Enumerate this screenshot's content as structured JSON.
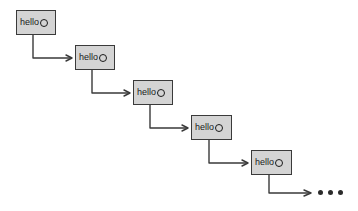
{
  "diagram": {
    "type": "linked-list-chain",
    "title": "",
    "background_color": "#ffffff",
    "node_fill_color": "#d4d4d4",
    "node_border_color": "#3a3a3a",
    "connector_color": "#3a3a3a",
    "text_color": "#1a1a1a",
    "node_label": "hello",
    "node_pointer_icon": "empty-circle-ring",
    "nodes": [
      {
        "id": "node-1",
        "label": "hello",
        "pointer": "ring",
        "x": 16,
        "y": 10,
        "width": 40,
        "height": 25
      },
      {
        "id": "node-2",
        "label": "hello",
        "pointer": "ring",
        "x": 75,
        "y": 45,
        "width": 40,
        "height": 25
      },
      {
        "id": "node-3",
        "label": "hello",
        "pointer": "ring",
        "x": 133,
        "y": 80,
        "width": 40,
        "height": 25
      },
      {
        "id": "node-4",
        "label": "hello",
        "pointer": "ring",
        "x": 191,
        "y": 115,
        "width": 41,
        "height": 25
      },
      {
        "id": "node-5",
        "label": "hello",
        "pointer": "ring",
        "x": 251,
        "y": 150,
        "width": 41,
        "height": 25
      }
    ],
    "connectors": [
      {
        "id": "connector-1",
        "from": "node-1",
        "to": "node-2",
        "style": "elbow-down-right",
        "arrowhead": "open-v"
      },
      {
        "id": "connector-2",
        "from": "node-2",
        "to": "node-3",
        "style": "elbow-down-right",
        "arrowhead": "open-v"
      },
      {
        "id": "connector-3",
        "from": "node-3",
        "to": "node-4",
        "style": "elbow-down-right",
        "arrowhead": "open-v"
      },
      {
        "id": "connector-4",
        "from": "node-4",
        "to": "node-5",
        "style": "elbow-down-right",
        "arrowhead": "open-v"
      },
      {
        "id": "connector-5",
        "from": "node-5",
        "to": "ellipsis",
        "style": "elbow-down-right",
        "arrowhead": "open-v"
      }
    ],
    "ellipsis": {
      "id": "ellipsis",
      "dots": 3,
      "x": 318,
      "y": 190,
      "meaning": "continues"
    }
  }
}
